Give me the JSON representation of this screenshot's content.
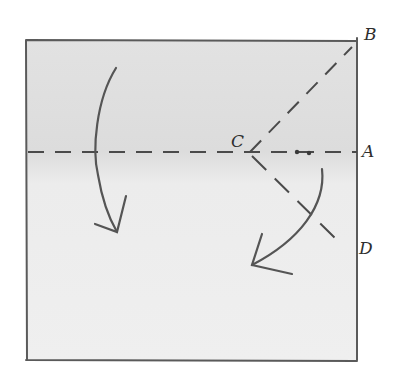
{
  "diagram": {
    "type": "origami-fold-instructions",
    "paper": {
      "x": 26,
      "y": 40,
      "width": 331,
      "height": 320,
      "fill": "#e9e9e9",
      "edge_color": "#5a5a5a"
    },
    "points": {
      "A": {
        "label": "A",
        "x": 357,
        "y": 152
      },
      "B": {
        "label": "B",
        "x": 357,
        "y": 45
      },
      "C": {
        "label": "C",
        "x": 250,
        "y": 152
      },
      "D": {
        "label": "D",
        "x": 357,
        "y": 255
      }
    },
    "fold_lines": [
      {
        "name": "horizontal-valley-fold",
        "from": "left-edge",
        "to": "A",
        "style": "dashed"
      },
      {
        "name": "diagonal-fold-CB",
        "from": "C",
        "to": "B",
        "style": "dashed"
      },
      {
        "name": "diagonal-fold-CD",
        "from": "C",
        "to": "D",
        "style": "dashed"
      }
    ],
    "arrows": [
      {
        "name": "fold-down-arrow-left",
        "direction": "down"
      },
      {
        "name": "fold-down-arrow-right",
        "direction": "down-left"
      }
    ],
    "markers": [
      {
        "name": "dot-pair",
        "count": 2
      }
    ],
    "line_color": "#4a4a4a"
  }
}
